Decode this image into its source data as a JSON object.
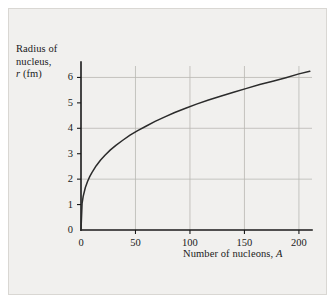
{
  "chart_data": {
    "type": "line",
    "title": "",
    "xlabel": "Number of nucleons, A",
    "xlabel_parts": {
      "text": "Number of nucleons, ",
      "symbol": "A"
    },
    "ylabel": "Radius of nucleus, r (fm)",
    "ylabel_lines": [
      "Radius of",
      "nucleus,"
    ],
    "ylabel_unit": {
      "symbol": "r",
      "text": " (fm)"
    },
    "xlim": [
      0,
      212
    ],
    "ylim": [
      0,
      6.45
    ],
    "xticks": [
      0,
      50,
      100,
      150,
      200
    ],
    "xtick_labels": [
      "0",
      "50",
      "100",
      "150",
      "200"
    ],
    "yticks": [
      0,
      1,
      2,
      3,
      4,
      5,
      6
    ],
    "ytick_labels": [
      "0",
      "1",
      "2",
      "3",
      "4",
      "5",
      "6"
    ],
    "gridlines_x": [
      50,
      100,
      150,
      200
    ],
    "gridlines_y": [
      2,
      4,
      6
    ],
    "grid": true,
    "legend": false,
    "formula": "r = 1.05 * A^(1/3)",
    "series": [
      {
        "name": "Nuclear radius",
        "color": "#2b2b2b",
        "x": [
          0,
          1,
          2,
          4,
          6,
          8,
          10,
          14,
          18,
          22,
          27,
          32,
          38,
          45,
          52,
          60,
          68,
          77,
          86,
          96,
          106,
          117,
          128,
          140,
          152,
          164,
          176,
          188,
          200,
          210
        ],
        "values": [
          0,
          1.05,
          1.32,
          1.67,
          1.91,
          2.1,
          2.26,
          2.53,
          2.75,
          2.94,
          3.15,
          3.33,
          3.52,
          3.73,
          3.91,
          4.09,
          4.27,
          4.45,
          4.62,
          4.79,
          4.95,
          5.11,
          5.26,
          5.42,
          5.57,
          5.72,
          5.85,
          5.99,
          6.14,
          6.24
        ]
      }
    ],
    "key_points": [
      {
        "x": 50,
        "y": 3.87
      },
      {
        "x": 100,
        "y": 4.87
      },
      {
        "x": 150,
        "y": 5.58
      },
      {
        "x": 200,
        "y": 6.14
      }
    ],
    "axis_color": "#1a1a1a",
    "grid_color": "#b9b7b3",
    "curve_color": "#2b2b2b",
    "background_color": "#f1f0ee"
  }
}
